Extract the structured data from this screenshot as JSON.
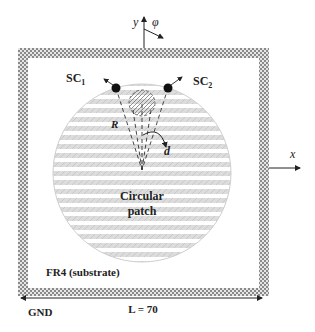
{
  "figure": {
    "axes": {
      "y_label": "y",
      "phi_label": "φ",
      "x_label": "x"
    },
    "ports": {
      "sc1": "SC",
      "sc1_sub": "1",
      "sc2": "SC",
      "sc2_sub": "2"
    },
    "patch": {
      "label_line1": "Circular",
      "label_line2": "patch",
      "radius_label": "R",
      "offset_label": "d"
    },
    "substrate_label": "FR4 (substrate)",
    "ground_label": "GND",
    "dimension_label": "L = 70",
    "colors": {
      "ink": "#222222",
      "hatch": "#c8c8c8",
      "ground": "#9a9a9a"
    }
  }
}
